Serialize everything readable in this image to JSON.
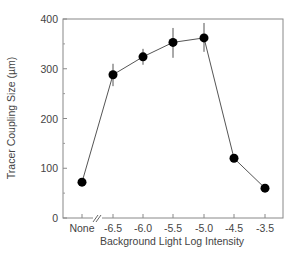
{
  "chart_data": {
    "type": "line",
    "title": "",
    "xlabel": "Background Light Log Intensity",
    "ylabel": "Tracer Coupling Size (µm)",
    "categories": [
      "None",
      "-6.5",
      "-6.0",
      "-5.5",
      "-5.0",
      "-4.5",
      "-3.5"
    ],
    "series": [
      {
        "name": "Tracer coupling size",
        "values": [
          72,
          288,
          324,
          353,
          362,
          120,
          60
        ],
        "error_low": [
          66,
          265,
          308,
          322,
          334,
          115,
          57
        ],
        "error_high": [
          78,
          310,
          340,
          382,
          392,
          125,
          63
        ]
      }
    ],
    "ylim": [
      0,
      400
    ],
    "yticks": [
      0,
      100,
      200,
      300,
      400
    ],
    "yminor_ticks": [
      50,
      150,
      250,
      350
    ],
    "grid": false,
    "legend": "none",
    "axis_break": "between None and -6.5",
    "marker": "filled-circle",
    "color": "#000000"
  },
  "labels": {
    "xlabel": "Background Light Log Intensity",
    "ylabel": "Tracer Coupling Size (µm)",
    "yticks": [
      "0",
      "100",
      "200",
      "300",
      "400"
    ],
    "xticks": [
      "None",
      "-6.5",
      "-6.0",
      "-5.5",
      "-5.0",
      "-4.5",
      "-3.5"
    ]
  }
}
